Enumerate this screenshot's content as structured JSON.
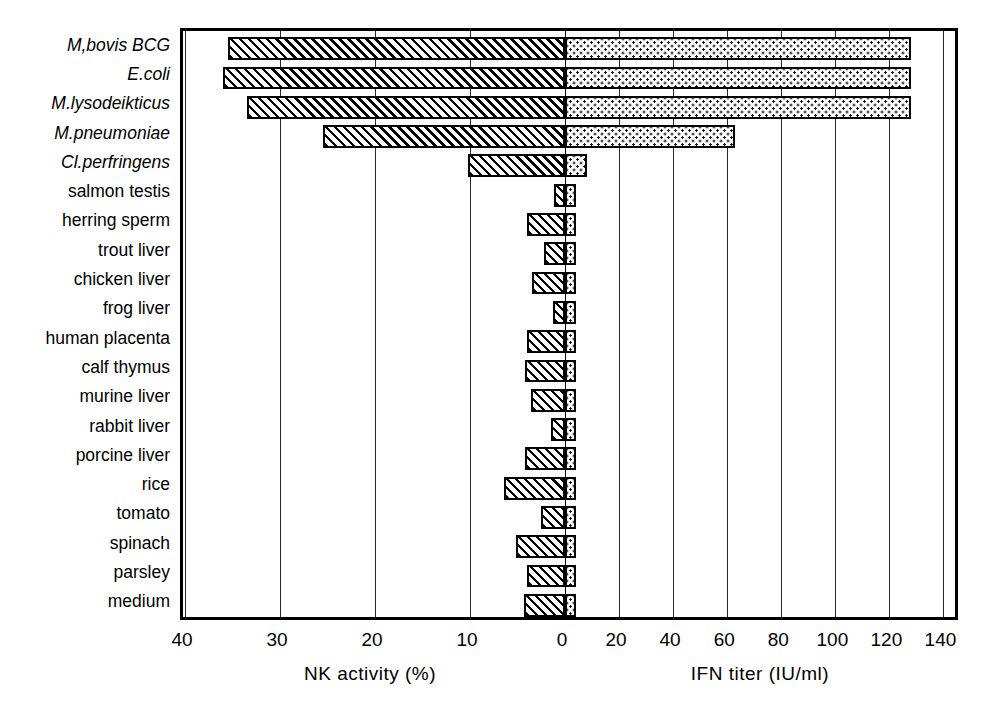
{
  "chart_data": {
    "type": "bar",
    "orientation": "horizontal",
    "style": "diverging-bidirectional",
    "title": "",
    "categories": [
      "M,bovis BCG",
      "E.coli",
      "M.lysodeikticus",
      "M.pneumoniae",
      "Cl.perfringens",
      "salmon testis",
      "herring sperm",
      "trout liver",
      "chicken liver",
      "frog liver",
      "human placenta",
      "calf thymus",
      "murine liver",
      "rabbit liver",
      "porcine liver",
      "rice",
      "tomato",
      "spinach",
      "parsley",
      "medium"
    ],
    "category_italic": [
      true,
      true,
      true,
      true,
      true,
      false,
      false,
      false,
      false,
      false,
      false,
      false,
      false,
      false,
      false,
      false,
      false,
      false,
      false,
      false
    ],
    "series": [
      {
        "name": "NK activity",
        "axis": "left",
        "units": "%",
        "xlabel": "NK activity  (%)",
        "xlim": [
          40,
          0
        ],
        "ticks": [
          40,
          30,
          20,
          10,
          0
        ],
        "fill": "diagonal-hatch",
        "values": [
          35.5,
          36.0,
          33.5,
          25.5,
          10.2,
          1.2,
          4.0,
          2.2,
          3.5,
          1.3,
          4.0,
          4.2,
          3.6,
          1.5,
          4.2,
          6.4,
          2.5,
          5.2,
          4.0,
          4.3
        ]
      },
      {
        "name": "IFN titer",
        "axis": "right",
        "units": "IU/ml",
        "xlabel": "IFN  titer (IU/ml)",
        "xlim": [
          0,
          140
        ],
        "ticks": [
          0,
          20,
          40,
          60,
          80,
          100,
          120,
          140
        ],
        "fill": "dotted-stipple",
        "values": [
          128,
          128,
          128,
          63,
          8,
          4,
          4,
          4,
          4,
          4,
          4,
          4,
          4,
          4,
          4,
          4,
          4,
          4,
          4,
          4
        ]
      }
    ],
    "grid": true,
    "legend": "none",
    "colors": {
      "line": "#000000",
      "background": "#ffffff",
      "hatch": "#000000",
      "stipple": "#1a1a1a"
    }
  },
  "axes": {
    "left": {
      "title": "NK activity  (%)",
      "tick_labels": [
        "40",
        "30",
        "20",
        "10",
        "0"
      ]
    },
    "right": {
      "title": "IFN  titer (IU/ml)",
      "tick_labels": [
        "0",
        "20",
        "40",
        "60",
        "80",
        "100",
        "120",
        "140"
      ]
    }
  }
}
